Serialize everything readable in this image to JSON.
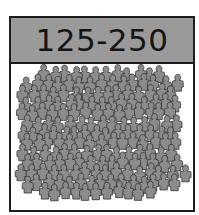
{
  "card": {
    "label": "125-250",
    "header_color": "#9a9a9a",
    "border_color": "#1e1e1e",
    "figure_fill": "#8c8c8c",
    "figure_stroke": "#333333",
    "icon": "crowd-of-people-icon"
  }
}
